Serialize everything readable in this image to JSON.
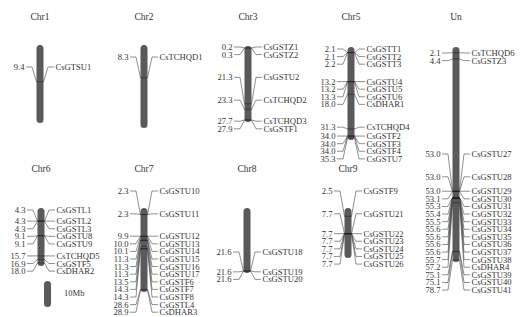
{
  "figure": {
    "scale_bar": {
      "label": "10Mb",
      "length_mb": 10
    }
  },
  "chromosomes": [
    {
      "name": "Chr1",
      "x": 40,
      "title_y": 20,
      "top": 45,
      "bottom": 123,
      "length_mb": 20,
      "genes": [
        {
          "pos": "9.4",
          "gene": "CsGTSU1"
        }
      ]
    },
    {
      "name": "Chr2",
      "x": 144,
      "title_y": 20,
      "top": 45,
      "bottom": 128,
      "length_mb": 21,
      "genes": [
        {
          "pos": "8.3",
          "gene": "CsTCHQD1"
        }
      ]
    },
    {
      "name": "Chr3",
      "x": 248,
      "title_y": 20,
      "top": 46,
      "bottom": 122,
      "length_mb": 28,
      "genes": [
        {
          "pos": "0.2",
          "gene": "CsGSTZ1"
        },
        {
          "pos": "0.3",
          "gene": "CsGSTZ2"
        },
        {
          "pos": "21.3",
          "gene": "CsGSTU2"
        },
        {
          "pos": "23.3",
          "gene": "CsTCHQD2"
        },
        {
          "pos": "27.7",
          "gene": "CsTCHQD3"
        },
        {
          "pos": "27.9",
          "gene": "CsGSTF1"
        }
      ]
    },
    {
      "name": "Chr5",
      "x": 351,
      "title_y": 20,
      "top": 47,
      "bottom": 140,
      "length_mb": 35.5,
      "genes": [
        {
          "pos": "2.1",
          "gene": "CsGSTT1"
        },
        {
          "pos": "2.1",
          "gene": "CsGSTT2"
        },
        {
          "pos": "2.2",
          "gene": "CsGSTT3"
        },
        {
          "pos": "13.2",
          "gene": "CsGSTU4"
        },
        {
          "pos": "13.2",
          "gene": "CsGSTU5"
        },
        {
          "pos": "13.3",
          "gene": "CsGSTU6"
        },
        {
          "pos": "18.0",
          "gene": "CsDHAR1"
        },
        {
          "pos": "31.3",
          "gene": "CsTCHQD4"
        },
        {
          "pos": "34.0",
          "gene": "CsGSTF2"
        },
        {
          "pos": "34.0",
          "gene": "CsGSTF3"
        },
        {
          "pos": "34.0",
          "gene": "CsGSTF4"
        },
        {
          "pos": "35.3",
          "gene": "CsGSTU7"
        }
      ]
    },
    {
      "name": "Un",
      "x": 456,
      "title_y": 20,
      "top": 47,
      "bottom": 262,
      "length_mb": 79,
      "genes": [
        {
          "pos": "2.1",
          "gene": "CsTCHQD6"
        },
        {
          "pos": "4.4",
          "gene": "CsGSTZ3"
        },
        {
          "pos": "53.0",
          "gene": "CsGSTU27"
        },
        {
          "pos": "53.0",
          "gene": "CsGSTU28"
        },
        {
          "pos": "53.0",
          "gene": "CsGSTU29"
        },
        {
          "pos": "53.1",
          "gene": "CsGSTU30"
        },
        {
          "pos": "55.3",
          "gene": "CsGSTU31"
        },
        {
          "pos": "55.4",
          "gene": "CsGSTU32"
        },
        {
          "pos": "55.5",
          "gene": "CsGSTU33"
        },
        {
          "pos": "55.6",
          "gene": "CsGSTU34"
        },
        {
          "pos": "55.6",
          "gene": "CsGSTU35"
        },
        {
          "pos": "55.6",
          "gene": "CsGSTU36"
        },
        {
          "pos": "55.6",
          "gene": "CsGSTU37"
        },
        {
          "pos": "55.7",
          "gene": "CsGSTU38"
        },
        {
          "pos": "57.2",
          "gene": "CsDHAR4"
        },
        {
          "pos": "75.1",
          "gene": "CsGSTU39"
        },
        {
          "pos": "75.1",
          "gene": "CsGSTU40"
        },
        {
          "pos": "78.7",
          "gene": "CsGSTU41"
        }
      ]
    },
    {
      "name": "Chr6",
      "x": 41,
      "title_y": 172,
      "top": 208,
      "bottom": 266,
      "length_mb": 19,
      "genes": [
        {
          "pos": "4.3",
          "gene": "CsGSTL1"
        },
        {
          "pos": "4.3",
          "gene": "CsGSTL2"
        },
        {
          "pos": "4.3",
          "gene": "CsGSTL3"
        },
        {
          "pos": "9.1",
          "gene": "CsGSTU8"
        },
        {
          "pos": "9.1",
          "gene": "CsGSTU9"
        },
        {
          "pos": "15.7",
          "gene": "CsTCHQD5"
        },
        {
          "pos": "16.9",
          "gene": "CsGSTF5"
        },
        {
          "pos": "18.0",
          "gene": "CsDHAR2"
        }
      ]
    },
    {
      "name": "Chr7",
      "x": 144,
      "title_y": 172,
      "top": 208,
      "bottom": 292,
      "length_mb": 29.5,
      "genes": [
        {
          "pos": "2.3",
          "gene": "CsGSTU10"
        },
        {
          "pos": "2.3",
          "gene": "CsGSTU11"
        },
        {
          "pos": "9.9",
          "gene": "CsGSTU12"
        },
        {
          "pos": "10.0",
          "gene": "CsGSTU13"
        },
        {
          "pos": "10.1",
          "gene": "CsGSTU14"
        },
        {
          "pos": "11.3",
          "gene": "CsGSTU15"
        },
        {
          "pos": "11.3",
          "gene": "CsGSTU16"
        },
        {
          "pos": "11.3",
          "gene": "CsGSTU17"
        },
        {
          "pos": "13.5",
          "gene": "CsGSTF6"
        },
        {
          "pos": "14.3",
          "gene": "CsGSTF7"
        },
        {
          "pos": "14.3",
          "gene": "CsGSTF8"
        },
        {
          "pos": "28.6",
          "gene": "CsGSTL4"
        },
        {
          "pos": "28.9",
          "gene": "CsDHAR3"
        }
      ]
    },
    {
      "name": "Chr8",
      "x": 247,
      "title_y": 172,
      "top": 208,
      "bottom": 273,
      "length_mb": 22,
      "genes": [
        {
          "pos": "21.6",
          "gene": "CsGSTU18"
        },
        {
          "pos": "21.6",
          "gene": "CsGSTU19"
        },
        {
          "pos": "21.6",
          "gene": "CsGSTU20"
        }
      ]
    },
    {
      "name": "Chr9",
      "x": 348,
      "title_y": 172,
      "top": 208,
      "bottom": 258,
      "length_mb": 15,
      "genes": [
        {
          "pos": "2.5",
          "gene": "CsGSTF9"
        },
        {
          "pos": "7.7",
          "gene": "CsGSTU21"
        },
        {
          "pos": "7.7",
          "gene": "CsGSTU22"
        },
        {
          "pos": "7.7",
          "gene": "CsGSTU23"
        },
        {
          "pos": "7.7",
          "gene": "CsGSTU24"
        },
        {
          "pos": "7.7",
          "gene": "CsGSTU25"
        },
        {
          "pos": "7.7",
          "gene": "CsGSTU26"
        }
      ]
    }
  ],
  "label_layout": {
    "Chr1": {
      "label_start": 70
    },
    "Chr2": {
      "label_start": 60
    },
    "Chr3": {
      "label_start": 50
    },
    "Chr5": {
      "label_start": 52
    },
    "Un": {
      "label_start": 56,
      "group_breaks": {
        "2": 157
      }
    },
    "Chr6": {
      "label_start": 213
    },
    "Chr7": {
      "label_start": 194
    },
    "Chr8": {
      "label_start": 255
    },
    "Chr9": {
      "label_start": 194
    }
  },
  "colors": {
    "chromosome": "#5a5a5a",
    "text": "#333333",
    "connector": "#444444",
    "background": "#ffffff"
  }
}
